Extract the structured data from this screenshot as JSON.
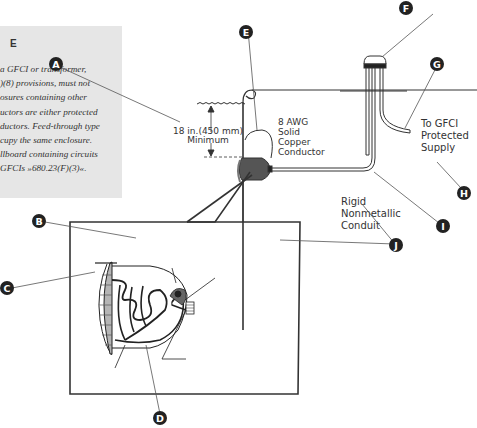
{
  "sidebar": {
    "heading": "E",
    "lines": [
      "a GFCI or transformer,",
      ")(8) provisions, must not",
      "osures containing other",
      "uctors are either protected",
      "ductors. Feed-through type",
      "cupy the same enclosure.",
      "llboard containing circuits",
      "GFCIs »680.23(F)(3)«."
    ]
  },
  "diagram": {
    "depth_label_line1": "18 in.(450 mm)",
    "depth_label_line2": "Minimum",
    "conductor_label": [
      "8 AWG",
      "Solid",
      "Copper",
      "Conductor"
    ],
    "supply_label": [
      "To GFCI",
      "Protected",
      "Supply"
    ],
    "conduit_label": [
      "Rigid",
      "Nonmetallic",
      "Conduit"
    ],
    "callouts": {
      "A": "A",
      "B": "B",
      "C": "C",
      "D": "D",
      "E": "E",
      "F": "F",
      "G": "G",
      "H": "H",
      "I": "I",
      "J": "J"
    },
    "colors": {
      "callout_fill": "#222222",
      "line": "#333333",
      "fixture_fill": "#555555",
      "sidebar_bg": "#e6e6e6"
    }
  }
}
